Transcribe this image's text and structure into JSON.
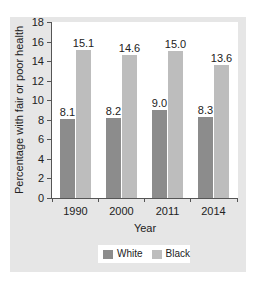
{
  "chart_data": {
    "type": "bar",
    "title": "",
    "xlabel": "Year",
    "ylabel": "Percentage with fair or poor health",
    "ylim": [
      0,
      18
    ],
    "yticks": [
      0,
      2,
      4,
      6,
      8,
      10,
      12,
      14,
      16,
      18
    ],
    "categories": [
      "1990",
      "2000",
      "2011",
      "2014"
    ],
    "series": [
      {
        "name": "White",
        "values": [
          8.1,
          8.2,
          9.0,
          8.3
        ],
        "labels": [
          "8.1",
          "8.2",
          "9.0",
          "8.3"
        ],
        "color": "#8c8c8c"
      },
      {
        "name": "Black",
        "values": [
          15.1,
          14.6,
          15.0,
          13.6
        ],
        "labels": [
          "15.1",
          "14.6",
          "15.0",
          "13.6"
        ],
        "color": "#bdbdbd"
      }
    ],
    "legend_position": "bottom",
    "grid": false
  },
  "colors": {
    "panel_background": "#e6e6e6",
    "plot_background": "#ffffff"
  }
}
